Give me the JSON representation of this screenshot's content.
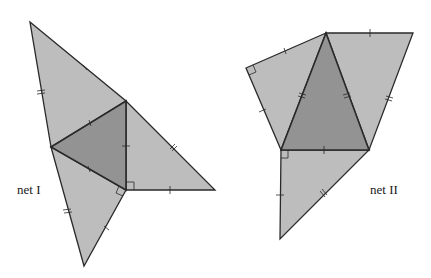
{
  "figure": {
    "colors": {
      "outer_faces": "#bdbdbd",
      "base_face": "#939393",
      "edges": "#2a2a2a",
      "background": "#ffffff"
    }
  },
  "nets": [
    {
      "label": "net I",
      "base_face": [
        [
          51,
          147
        ],
        [
          126,
          101
        ],
        [
          126,
          190
        ]
      ],
      "outer_faces": [
        [
          [
            30,
            22
          ],
          [
            126,
            101
          ],
          [
            51,
            147
          ]
        ],
        [
          [
            126,
            101
          ],
          [
            215,
            190
          ],
          [
            126,
            190
          ]
        ],
        [
          [
            51,
            147
          ],
          [
            126,
            190
          ],
          [
            84,
            266
          ]
        ]
      ],
      "right_angles": [
        "at (126,190) in right face",
        "at (126,190) in bottom face"
      ]
    },
    {
      "label": "net II",
      "base_face": [
        [
          326,
          33
        ],
        [
          281,
          150
        ],
        [
          369,
          150
        ]
      ],
      "outer_faces": [
        [
          [
            326,
            33
          ],
          [
            246,
            68
          ],
          [
            281,
            150
          ]
        ],
        [
          [
            326,
            33
          ],
          [
            413,
            33
          ],
          [
            369,
            150
          ]
        ],
        [
          [
            281,
            150
          ],
          [
            369,
            150
          ],
          [
            280,
            239
          ]
        ]
      ],
      "right_angles": [
        "at (246,68) in left face",
        "at (281,150) in bottom face"
      ]
    }
  ]
}
